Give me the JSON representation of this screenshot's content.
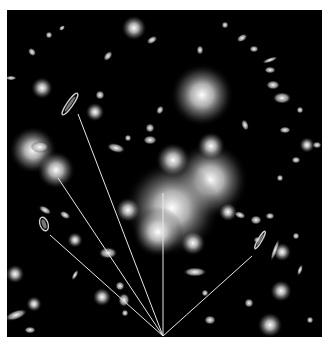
{
  "image": {
    "subject": "galaxy cluster with gravitationally lensed arcs",
    "background_color": "#000000",
    "frame_color": "#ffffff",
    "line_color": "#e8e8e8"
  },
  "lines": {
    "origin": [
      163,
      336
    ],
    "targets": [
      [
        78,
        114
      ],
      [
        58,
        178
      ],
      [
        50,
        235
      ],
      [
        163,
        193
      ],
      [
        252,
        256
      ]
    ]
  },
  "bright_galaxies": [
    {
      "cx": 202,
      "cy": 95,
      "r": 20
    },
    {
      "cx": 210,
      "cy": 180,
      "r": 24
    },
    {
      "cx": 172,
      "cy": 208,
      "r": 30
    },
    {
      "cx": 158,
      "cy": 232,
      "r": 16
    },
    {
      "cx": 173,
      "cy": 160,
      "r": 11
    },
    {
      "cx": 33,
      "cy": 150,
      "r": 15
    },
    {
      "cx": 56,
      "cy": 170,
      "r": 12
    },
    {
      "cx": 134,
      "cy": 28,
      "r": 8
    },
    {
      "cx": 42,
      "cy": 88,
      "r": 7
    },
    {
      "cx": 95,
      "cy": 112,
      "r": 6
    },
    {
      "cx": 211,
      "cy": 146,
      "r": 9
    },
    {
      "cx": 128,
      "cy": 210,
      "r": 8
    },
    {
      "cx": 193,
      "cy": 243,
      "r": 8
    },
    {
      "cx": 282,
      "cy": 252,
      "r": 6
    },
    {
      "cx": 270,
      "cy": 325,
      "r": 8
    },
    {
      "cx": 102,
      "cy": 297,
      "r": 6
    },
    {
      "cx": 15,
      "cy": 274,
      "r": 6
    },
    {
      "cx": 75,
      "cy": 240,
      "r": 5
    },
    {
      "cx": 281,
      "cy": 291,
      "r": 7
    },
    {
      "cx": 34,
      "cy": 304,
      "r": 5
    },
    {
      "cx": 228,
      "cy": 212,
      "r": 6
    },
    {
      "cx": 307,
      "cy": 145,
      "r": 5
    }
  ],
  "small_galaxies": [
    [
      282,
      98,
      8,
      5,
      0
    ],
    [
      273,
      85,
      6,
      4,
      0
    ],
    [
      270,
      70,
      5,
      3,
      0
    ],
    [
      270,
      60,
      7,
      2,
      -20
    ],
    [
      242,
      38,
      5,
      3,
      -30
    ],
    [
      254,
      49,
      4,
      3,
      0
    ],
    [
      200,
      50,
      3,
      4,
      0
    ],
    [
      225,
      25,
      3,
      3,
      0
    ],
    [
      317,
      145,
      4,
      3,
      0
    ],
    [
      285,
      130,
      5,
      3,
      0
    ],
    [
      300,
      110,
      3,
      3,
      0
    ],
    [
      245,
      125,
      3,
      5,
      -20
    ],
    [
      280,
      178,
      3,
      3,
      0
    ],
    [
      296,
      160,
      4,
      3,
      0
    ],
    [
      160,
      110,
      3,
      4,
      30
    ],
    [
      150,
      140,
      6,
      4,
      0
    ],
    [
      152,
      40,
      5,
      3,
      -30
    ],
    [
      100,
      95,
      4,
      4,
      0
    ],
    [
      108,
      56,
      3,
      5,
      40
    ],
    [
      32,
      52,
      3,
      4,
      -40
    ],
    [
      11,
      78,
      5,
      2,
      0
    ],
    [
      62,
      28,
      3,
      2,
      -40
    ],
    [
      49,
      35,
      3,
      3,
      0
    ],
    [
      40,
      147,
      8,
      5,
      0
    ],
    [
      116,
      148,
      8,
      4,
      15
    ],
    [
      128,
      138,
      3,
      3,
      0
    ],
    [
      150,
      128,
      4,
      4,
      0
    ],
    [
      65,
      215,
      5,
      3,
      30
    ],
    [
      45,
      210,
      6,
      3,
      30
    ],
    [
      108,
      253,
      8,
      5,
      0
    ],
    [
      124,
      300,
      5,
      6,
      0
    ],
    [
      120,
      286,
      4,
      4,
      0
    ],
    [
      125,
      313,
      3,
      3,
      0
    ],
    [
      16,
      315,
      10,
      4,
      -20
    ],
    [
      30,
      330,
      5,
      3,
      0
    ],
    [
      75,
      275,
      2,
      5,
      30
    ],
    [
      195,
      272,
      10,
      4,
      0
    ],
    [
      240,
      215,
      5,
      3,
      20
    ],
    [
      270,
      216,
      4,
      3,
      0
    ],
    [
      256,
      220,
      5,
      4,
      0
    ],
    [
      275,
      250,
      2,
      10,
      20
    ],
    [
      296,
      236,
      3,
      3,
      0
    ],
    [
      249,
      303,
      4,
      4,
      0
    ],
    [
      210,
      320,
      5,
      4,
      0
    ],
    [
      205,
      293,
      3,
      3,
      0
    ],
    [
      258,
      240,
      4,
      3,
      0
    ],
    [
      300,
      270,
      2,
      5,
      20
    ],
    [
      310,
      320,
      3,
      3,
      0
    ]
  ],
  "lensed_arcs": [
    {
      "cx": 70,
      "cy": 104,
      "rx": 3,
      "ry": 13,
      "rot": 35
    },
    {
      "cx": 44,
      "cy": 224,
      "rx": 4,
      "ry": 7,
      "rot": -20
    },
    {
      "cx": 260,
      "cy": 240,
      "rx": 2,
      "ry": 10,
      "rot": 30
    }
  ]
}
